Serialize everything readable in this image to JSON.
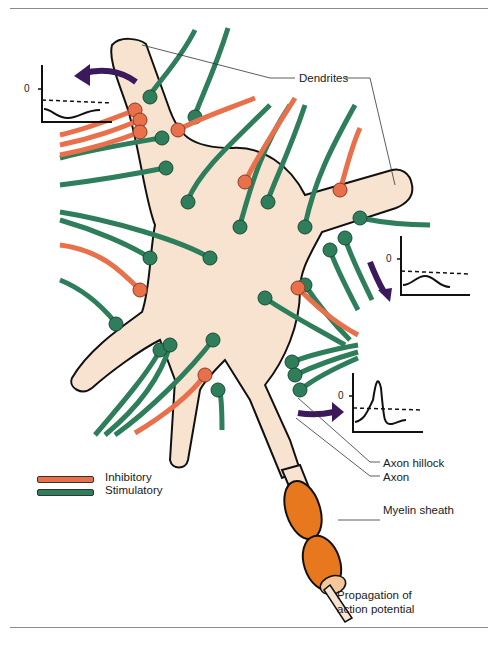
{
  "figure": {
    "labels": {
      "dendrites": "Dendrites",
      "axon_hillock": "Axon hillock",
      "axon": "Axon",
      "myelin_sheath": "Myelin sheath",
      "propagation_line1": "Propagation of",
      "propagation_line2": "action potential"
    },
    "legend": [
      {
        "label": "Inhibitory",
        "color": "#e8704a"
      },
      {
        "label": "Stimulatory",
        "color": "#2e7d5b"
      }
    ],
    "graphs": [
      {
        "position": "upper-left",
        "zero_label": "0",
        "trace": "hyperpolarization dip below threshold"
      },
      {
        "position": "right",
        "zero_label": "0",
        "trace": "subthreshold depolarization bump"
      },
      {
        "position": "lower-right",
        "zero_label": "0",
        "trace": "action potential spike above threshold"
      }
    ],
    "colors": {
      "cell_body": "#f7e3d0",
      "outline": "#111111",
      "inhibitory": "#e8704a",
      "stimulatory": "#2e7d5b",
      "myelin": "#e8781e",
      "arrow": "#3a1a5c"
    }
  }
}
